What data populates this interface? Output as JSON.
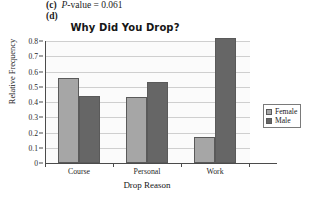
{
  "answers": [
    {
      "label": "(c)",
      "text_prefix": "P",
      "text_rest": "-value  =  0.061"
    },
    {
      "label": "(d)",
      "text_prefix": "",
      "text_rest": ""
    }
  ],
  "chart_data": {
    "type": "bar",
    "title": "Why Did You Drop?",
    "xlabel": "Drop Reason",
    "ylabel": "Relative Frequency",
    "categories": [
      "Course",
      "Personal",
      "Work"
    ],
    "series": [
      {
        "name": "Female",
        "values": [
          0.56,
          0.43,
          0.17
        ],
        "color": "#a6a6a6"
      },
      {
        "name": "Male",
        "values": [
          0.44,
          0.53,
          0.82
        ],
        "color": "#666666"
      }
    ],
    "ylim": [
      0,
      0.8
    ],
    "ytick_labels": [
      "0",
      "0.1",
      "0.2",
      "0.3",
      "0.4",
      "0.5",
      "0.6",
      "0.7",
      "0.8"
    ],
    "ytick_values": [
      0,
      0.1,
      0.2,
      0.3,
      0.4,
      0.5,
      0.6,
      0.7,
      0.8
    ],
    "grid": true,
    "legend_position": "right"
  }
}
